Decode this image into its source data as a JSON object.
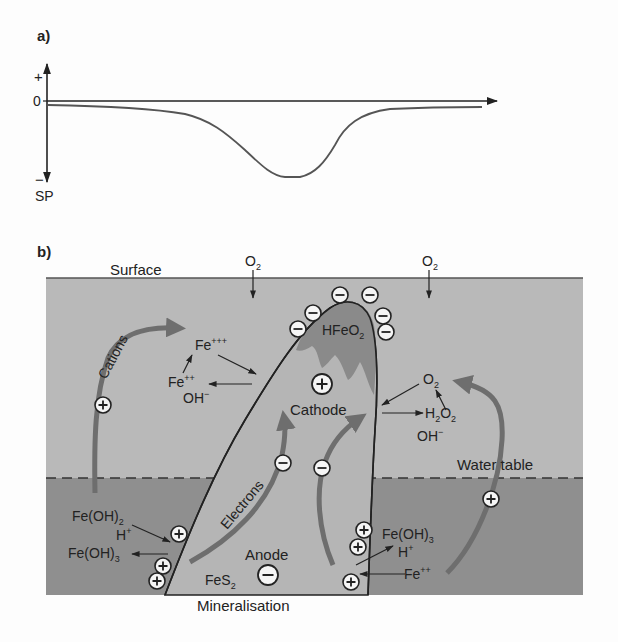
{
  "panel_a": {
    "label": "a)",
    "axis": {
      "plus": "+",
      "zero": "0",
      "minus": "−",
      "ylabel": "SP"
    }
  },
  "panel_b": {
    "label": "b)",
    "surface": "Surface",
    "o2_left": "O",
    "o2_left_sub": "2",
    "o2_right": "O",
    "o2_right_sub": "2",
    "cations": "Cations",
    "fe3": "Fe",
    "fe3_sup": "+++",
    "fe2": "Fe",
    "fe2_sup": "++",
    "oh_left": "OH",
    "oh_left_sup": "−",
    "hfeo2": "HFeO",
    "hfeo2_sub": "2",
    "cathode": "Cathode",
    "o2_mid": "O",
    "o2_mid_sub": "2",
    "h2o2_a": "H",
    "h2o2_sub1": "2",
    "h2o2_b": "O",
    "h2o2_sub2": "2",
    "oh_right": "OH",
    "oh_right_sup": "−",
    "electrons": "Electrons",
    "water_table": "Water table",
    "feoh2_left": "Fe(OH)",
    "feoh2_left_sub": "2",
    "hplus_left": "H",
    "hplus_left_sup": "+",
    "feoh3_left": "Fe(OH)",
    "feoh3_left_sub": "3",
    "anode": "Anode",
    "fes2": "FeS",
    "fes2_sub": "2",
    "feoh3_right": "Fe(OH)",
    "feoh3_right_sub": "3",
    "hplus_right": "H",
    "hplus_right_sup": "+",
    "fe2_right": "Fe",
    "fe2_right_sup": "++",
    "mineralisation": "Mineralisation",
    "plus_sign": "+",
    "minus_sign": "−"
  },
  "colors": {
    "upper_zone": "#b9b9b9",
    "lower_zone": "#8f8f8f",
    "orebody": "#b5b5b5",
    "oxidized_cap": "#8a8a8a",
    "arrow_gray": "#6e6e6e",
    "line": "#222222"
  }
}
